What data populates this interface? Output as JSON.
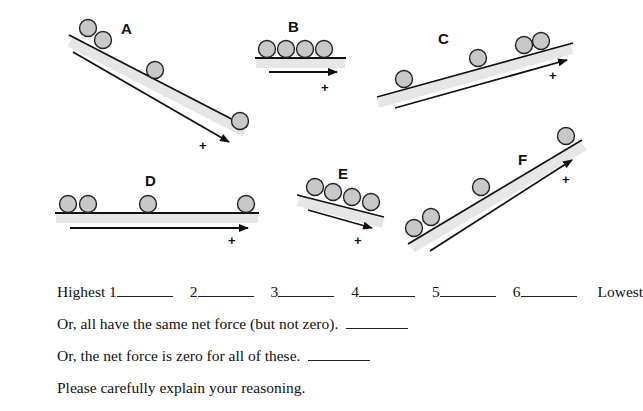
{
  "diagram": {
    "panels": [
      {
        "label": "A",
        "type": "incline-down",
        "balls": 4,
        "direction_sign": "+"
      },
      {
        "label": "B",
        "type": "horizontal",
        "balls": 4,
        "direction_sign": "+"
      },
      {
        "label": "C",
        "type": "incline-up",
        "balls": 4,
        "direction_sign": "+"
      },
      {
        "label": "D",
        "type": "horizontal",
        "balls": 4,
        "direction_sign": "+"
      },
      {
        "label": "E",
        "type": "incline-down",
        "balls": 4,
        "direction_sign": "+"
      },
      {
        "label": "F",
        "type": "incline-up",
        "balls": 4,
        "direction_sign": "+"
      }
    ],
    "colors": {
      "ball_fill": "#c8c8c8",
      "line": "#111111",
      "surface_shade": "#e6e6e6"
    }
  },
  "ranking": {
    "start_label": "Highest",
    "end_label": "Lowest",
    "slots": [
      "1",
      "2",
      "3",
      "4",
      "5",
      "6"
    ]
  },
  "questions": {
    "same_nonzero": "Or, all have the same net force (but not zero).",
    "all_zero": "Or, the net force is zero for all of these.",
    "explain": "Please carefully explain your reasoning."
  }
}
